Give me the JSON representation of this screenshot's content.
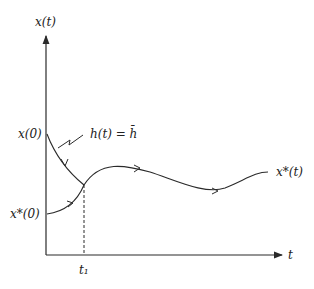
{
  "diagram": {
    "axes": {
      "y_label": "x(t)",
      "x_label": "t"
    },
    "labels": {
      "x0": "x(0)",
      "xstar0": "x*(0)",
      "h_eq": "h(t) = h̄",
      "xstar_t": "x*(t)",
      "t1": "t₁"
    },
    "colors": {
      "stroke": "#2a2a2a",
      "background": "#ffffff"
    }
  }
}
